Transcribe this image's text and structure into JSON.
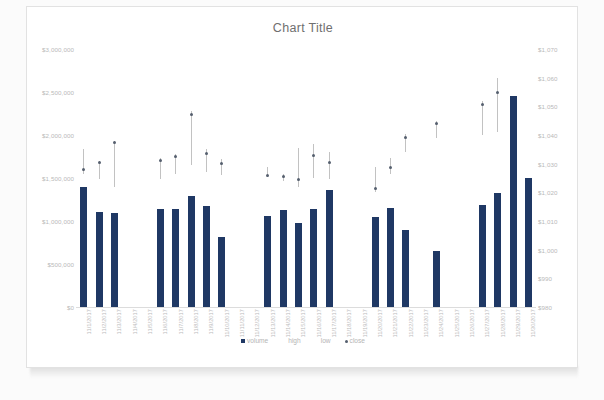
{
  "chart": {
    "title": "Chart Title",
    "legend": [
      {
        "label": "volume",
        "marker": "square",
        "color": "#1F3864"
      },
      {
        "label": "high",
        "marker": "none",
        "color": "#C2C2C2"
      },
      {
        "label": "low",
        "marker": "none",
        "color": "#C2C2C2"
      },
      {
        "label": "close",
        "marker": "dot",
        "color": "#555F6E"
      }
    ],
    "left_axis_labels": [
      "$3,000,000",
      "$2,500,000",
      "$2,000,000",
      "$1,500,000",
      "$1,000,000",
      "$500,000",
      "$0"
    ],
    "right_axis_labels": [
      "$1,070",
      "$1,060",
      "$1,050",
      "$1,040",
      "$1,030",
      "$1,020",
      "$1,010",
      "$1,000",
      "$990",
      "$980"
    ]
  },
  "chart_data": {
    "type": "bar",
    "title": "Chart Title",
    "xlabel": "",
    "ylabel": "",
    "grid": false,
    "legend_position": "bottom",
    "y_left": {
      "label": "volume",
      "min": 0,
      "max": 3000000,
      "ticks": [
        0,
        500000,
        1000000,
        1500000,
        2000000,
        2500000,
        3000000
      ],
      "tick_labels": [
        "$0",
        "$500,000",
        "$1,000,000",
        "$1,500,000",
        "$2,000,000",
        "$2,500,000",
        "$3,000,000"
      ]
    },
    "y_right": {
      "label": "price",
      "min": 980,
      "max": 1070,
      "ticks": [
        980,
        990,
        1000,
        1010,
        1020,
        1030,
        1040,
        1050,
        1060,
        1070
      ],
      "tick_labels": [
        "$980",
        "$990",
        "$1,000",
        "$1,010",
        "$1,020",
        "$1,030",
        "$1,040",
        "$1,050",
        "$1,060",
        "$1,070"
      ]
    },
    "categories": [
      "11/1/2017",
      "11/2/2017",
      "11/3/2017",
      "11/4/2017",
      "11/5/2017",
      "11/6/2017",
      "11/7/2017",
      "11/8/2017",
      "11/9/2017",
      "11/10/2017",
      "11/11/2017",
      "11/12/2017",
      "11/13/2017",
      "11/14/2017",
      "11/15/2017",
      "11/16/2017",
      "11/17/2017",
      "11/18/2017",
      "11/19/2017",
      "11/20/2017",
      "11/21/2017",
      "11/22/2017",
      "11/23/2017",
      "11/24/2017",
      "11/25/2017",
      "11/26/2017",
      "11/27/2017",
      "11/28/2017",
      "11/29/2017",
      "11/30/2017"
    ],
    "series": [
      {
        "name": "volume",
        "axis": "left",
        "type": "bar",
        "color": "#1F3864",
        "values": [
          1400000,
          1100000,
          1090000,
          null,
          null,
          1140000,
          1140000,
          1290000,
          1170000,
          810000,
          null,
          null,
          1060000,
          1130000,
          980000,
          1140000,
          1360000,
          null,
          null,
          1050000,
          1150000,
          900000,
          null,
          650000,
          null,
          null,
          1190000,
          1320000,
          2450000,
          1500000
        ]
      },
      {
        "name": "high",
        "axis": "right",
        "type": "high",
        "color": "#C2C2C2",
        "values": [
          1035.0,
          1031.0,
          1038.0,
          null,
          null,
          1032.0,
          1033.5,
          1048.5,
          1035.0,
          1031.5,
          null,
          null,
          1029.0,
          1026.5,
          1035.5,
          1037.0,
          1034.0,
          null,
          null,
          1029.0,
          1032.0,
          1040.5,
          null,
          1045.0,
          null,
          null,
          1052.0,
          1060.0,
          null,
          null
        ]
      },
      {
        "name": "low",
        "axis": "right",
        "type": "low",
        "color": "#C2C2C2",
        "values": [
          1026.5,
          1024.5,
          1022.0,
          null,
          null,
          1024.5,
          1026.5,
          1029.5,
          1027.0,
          1026.0,
          null,
          null,
          1025.5,
          1024.0,
          1022.0,
          1025.0,
          1024.5,
          null,
          null,
          1020.0,
          1026.5,
          1034.0,
          null,
          1039.0,
          null,
          null,
          1040.0,
          1041.0,
          null,
          null
        ]
      },
      {
        "name": "close",
        "axis": "right",
        "type": "marker",
        "color": "#555F6E",
        "values": [
          1028.0,
          1030.5,
          1037.5,
          null,
          null,
          1031.0,
          1032.5,
          1047.0,
          1033.5,
          1030.0,
          null,
          null,
          1026.0,
          1025.5,
          1024.5,
          1033.0,
          1030.5,
          null,
          null,
          1021.5,
          1028.5,
          1039.0,
          null,
          1044.0,
          null,
          null,
          1050.5,
          1055.0,
          null,
          null
        ]
      }
    ]
  }
}
